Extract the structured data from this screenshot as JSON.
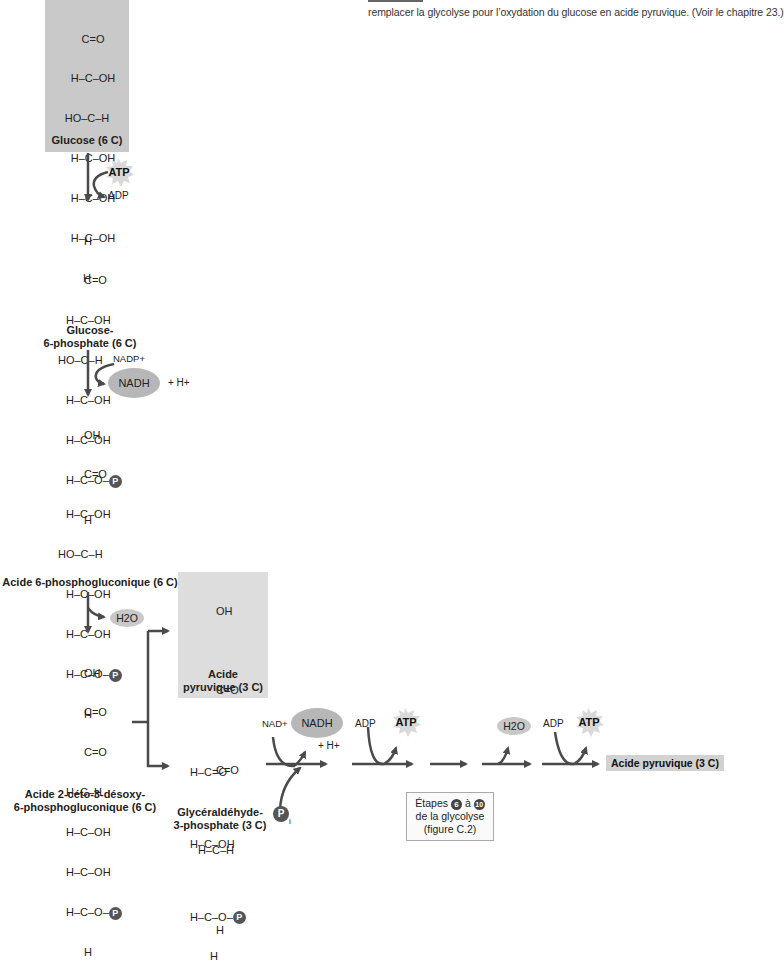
{
  "caption": {
    "text": "remplacer la glycolyse pour l’oxydation du glucose en acide pyruvique. (Voir le chapitre 23.)"
  },
  "molecules": {
    "glucose": {
      "rows": [
        "C=O",
        "H–C–OH",
        "HO–C–H",
        "H–C–OH",
        "H–C–OH",
        "H–C–OH",
        "H"
      ],
      "label": "Glucose (6 C)"
    },
    "glucose6p": {
      "rows": [
        "H",
        "C=O",
        "H–C–OH",
        "HO–C–H",
        "H–C–OH",
        "H–C–OH",
        "H–C–O–",
        "H"
      ],
      "label_line1": "Glucose-",
      "label_line2": "6-phosphate (6 C)"
    },
    "phosphogluconate": {
      "rows": [
        "OH",
        "C=O",
        "H–C–OH",
        "HO–C–H",
        "H–C–OH",
        "H–C–OH",
        "H–C–O–",
        "H"
      ],
      "label": "Acide 6-phosphogluconique (6 C)"
    },
    "kdpg": {
      "rows": [
        "OH",
        "C=O",
        "C=O",
        "H–C–H",
        "H–C–OH",
        "H–C–OH",
        "H–C–O–",
        "H"
      ],
      "label_line1": "Acide 2-céto-3-désoxy-",
      "label_line2": "6-phosphogluconique (6 C)"
    },
    "pyruvate_box": {
      "rows": [
        "OH",
        "C=O",
        "C=O",
        "H–C–H",
        "H"
      ],
      "label_line1": "Acide",
      "label_line2": "pyruvique (3 C)"
    },
    "g3p": {
      "rows": [
        "H–C=O",
        "H–C–OH",
        "H–C–O–",
        "H"
      ],
      "label_line1": "Glycéraldéhyde-",
      "label_line2": "3-phosphate (3 C)"
    }
  },
  "phosphate_symbol": "P",
  "phosphate_inorganic_sub": "i",
  "cofactors": {
    "step1": {
      "atp": "ATP",
      "adp": "ADP"
    },
    "step2": {
      "nadp": "NADP+",
      "nadh": "NADH",
      "plus_h": "+ H+"
    },
    "step3": {
      "water": "H2O"
    },
    "g3p_step": {
      "nad": "NAD+",
      "nadh": "NADH",
      "plus_h": "+ H+"
    },
    "atp_step_a": {
      "adp": "ADP",
      "atp": "ATP"
    },
    "water_step": {
      "water": "H2O"
    },
    "atp_step_b": {
      "adp": "ADP",
      "atp": "ATP"
    }
  },
  "steps_box": {
    "line1_prefix": "Étapes",
    "num_from": "6",
    "line1_mid": "à",
    "num_to": "10",
    "line2": "de la glycolyse",
    "line3": "(figure C.2)"
  },
  "final_product": "Acide pyruvique (3 C)",
  "colors": {
    "arrow": "#4a4a4a",
    "box_dark": "#c9c9c9",
    "box_light": "#dddddd",
    "ellipse": "#b7b7b7",
    "phosphate_circle": "#555555"
  }
}
